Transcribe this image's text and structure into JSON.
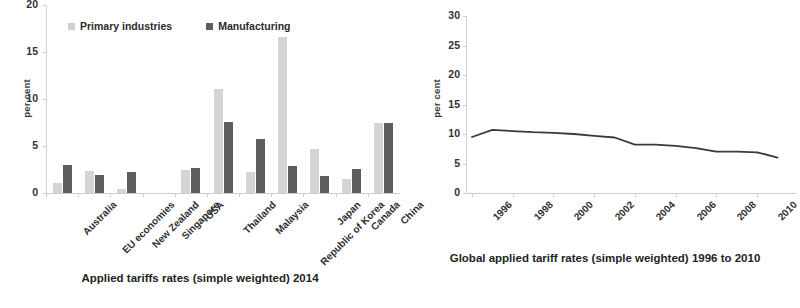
{
  "colors": {
    "primary_industries": "#d5d5d5",
    "manufacturing": "#5e5e5e",
    "line": "#3a3a3a",
    "axis": "#cccccc",
    "text": "#2b2b2b"
  },
  "left_caption": "Applied tariffs rates (simple weighted) 2014",
  "right_caption": "Global applied tariff rates (simple weighted) 1996 to 2010",
  "chart_data": [
    {
      "type": "bar",
      "title": "Applied tariffs rates (simple weighted) 2014",
      "xlabel": "",
      "ylabel": "per cent",
      "ylim": [
        0,
        20
      ],
      "yticks": [
        0,
        5,
        10,
        15,
        20
      ],
      "grid": false,
      "legend_position": "top-left",
      "categories": [
        "Australia",
        "EU economies",
        "New Zealand",
        "Singapore",
        "USA",
        "Thailand",
        "Malaysia",
        "Republic of Korea",
        "Japan",
        "Canada",
        "China"
      ],
      "series": [
        {
          "name": "Primary industries",
          "color": "#d5d5d5",
          "values": [
            1.1,
            2.3,
            0.4,
            0.0,
            2.4,
            11.1,
            2.2,
            16.6,
            4.7,
            1.5,
            7.5
          ]
        },
        {
          "name": "Manufacturing",
          "color": "#5e5e5e",
          "values": [
            3.0,
            1.9,
            2.2,
            0.0,
            2.7,
            7.6,
            5.7,
            2.9,
            1.8,
            2.6,
            7.4
          ]
        }
      ]
    },
    {
      "type": "line",
      "title": "Global applied tariff rates (simple weighted) 1996 to 2010",
      "xlabel": "",
      "ylabel": "per cent",
      "ylim": [
        0,
        30
      ],
      "yticks": [
        0,
        5,
        10,
        15,
        20,
        25,
        30
      ],
      "xticks": [
        "1996",
        "1998",
        "2000",
        "2002",
        "2004",
        "2006",
        "2008",
        "2010"
      ],
      "grid": false,
      "legend_position": "none",
      "x": [
        1996,
        1997,
        1998,
        1999,
        2000,
        2001,
        2002,
        2003,
        2004,
        2005,
        2006,
        2007,
        2008,
        2009,
        2010
      ],
      "series": [
        {
          "name": "Global applied tariff rate",
          "color": "#3a3a3a",
          "values": [
            9.5,
            10.7,
            10.5,
            10.3,
            10.2,
            10.0,
            9.7,
            9.4,
            8.2,
            8.2,
            8.0,
            7.6,
            7.0,
            7.0,
            6.9,
            6.0
          ]
        }
      ]
    }
  ]
}
